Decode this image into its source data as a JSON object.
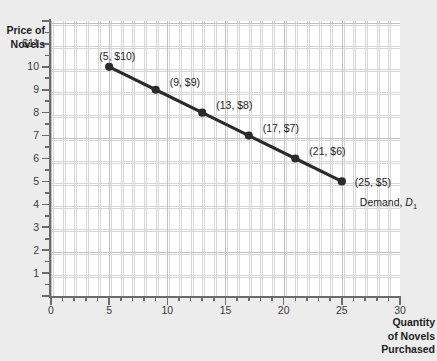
{
  "chart_data": {
    "type": "line",
    "title": "",
    "xlabel": "Quantity of Novels Purchased",
    "ylabel": "Price of Novels",
    "xlim": [
      0,
      30
    ],
    "ylim": [
      0,
      12
    ],
    "grid": true,
    "legend_position": "inline-annotation",
    "x_ticks": [
      "0",
      "5",
      "10",
      "15",
      "20",
      "25",
      "30"
    ],
    "x_tick_values": [
      0,
      5,
      10,
      15,
      20,
      25,
      30
    ],
    "y_ticks": [
      "1",
      "2",
      "3",
      "4",
      "5",
      "6",
      "7",
      "8",
      "9",
      "10",
      "$11"
    ],
    "y_tick_values": [
      1,
      2,
      3,
      4,
      5,
      6,
      7,
      8,
      9,
      10,
      11
    ],
    "series": [
      {
        "name": "Demand, D1",
        "annotation": "Demand, D",
        "annotation_subscript": "1",
        "color": "#2b2b2b",
        "x": [
          5,
          9,
          13,
          17,
          21,
          25
        ],
        "y": [
          10,
          9,
          8,
          7,
          6,
          5
        ],
        "point_labels": [
          "(5, $10)",
          "(9, $9)",
          "(13, $8)",
          "(17, $7)",
          "(21, $6)",
          "(25, $5)"
        ]
      }
    ]
  },
  "axes": {
    "y_title_lines": [
      "Price of",
      "Novels"
    ],
    "x_title_lines": [
      "Quantity",
      "of Novels",
      "Purchased"
    ]
  },
  "colors": {
    "curve": "#2b2b2b",
    "axis": "#6b6b6b",
    "grid_minor": "#c9c9c9",
    "grid_major": "#bdbdbd",
    "plot_background": "#ffffff",
    "page_background": "#ececec",
    "text": "#1d1d1d"
  }
}
